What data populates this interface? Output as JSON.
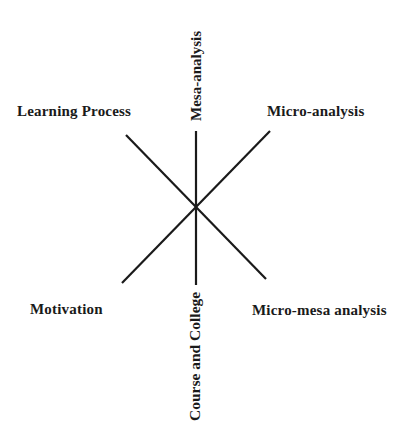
{
  "diagram": {
    "title": "",
    "center": {
      "x": 196,
      "y": 206
    },
    "line_color": "#1a1a1a",
    "labels": {
      "top": "Mesa-analysis",
      "bottom": "Course and College",
      "upper_left": "Learning Process",
      "upper_right": "Micro-analysis",
      "lower_left": "Motivation",
      "lower_right": "Micro-mesa analysis"
    },
    "axes": [
      {
        "name": "vertical",
        "from": "Mesa-analysis",
        "to": "Course and College",
        "x1": 196,
        "y1": 131,
        "x2": 196,
        "y2": 285
      },
      {
        "name": "diagonal-down",
        "from": "Learning Process",
        "to": "Micro-mesa analysis",
        "x1": 126,
        "y1": 135,
        "x2": 266,
        "y2": 279
      },
      {
        "name": "diagonal-up",
        "from": "Motivation",
        "to": "Micro-analysis",
        "x1": 122,
        "y1": 283,
        "x2": 270,
        "y2": 131
      }
    ]
  }
}
